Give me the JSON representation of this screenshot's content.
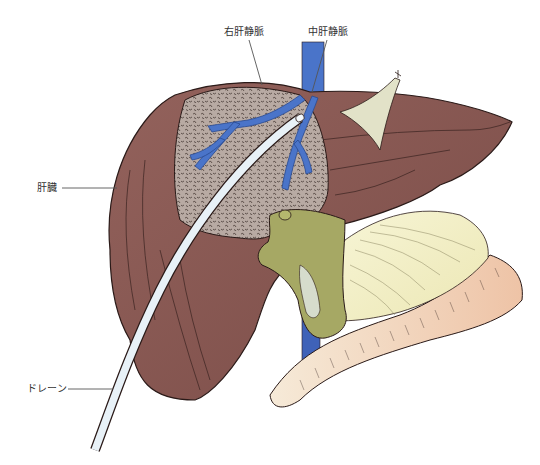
{
  "figure": {
    "type": "medical-illustration",
    "labels": [
      {
        "id": "right-hepatic-vein",
        "text": "右肝静脈",
        "x": 224,
        "y": 26
      },
      {
        "id": "middle-hepatic-vein",
        "text": "中肝静脈",
        "x": 308,
        "y": 26
      },
      {
        "id": "liver",
        "text": "肝臓",
        "x": 37,
        "y": 182
      },
      {
        "id": "drain",
        "text": "ドレーン",
        "x": 27,
        "y": 383
      }
    ],
    "colors": {
      "liver": "#8a5a55",
      "liver_dark": "#6e4440",
      "cut_surface": "#b8aaa3",
      "hepatic_vein": "#4a74c9",
      "vena_cava": "#3f62b8",
      "drain": "#e8f1f7",
      "hilum": "#a6a864",
      "fat": "#f3f0c8",
      "bowel": "#efcbb0",
      "ligament": "#e2e2c8",
      "outline": "#2a1a18"
    }
  }
}
